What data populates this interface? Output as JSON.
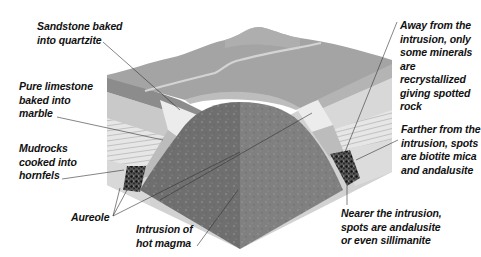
{
  "diagram": {
    "colors": {
      "background": "#ffffff",
      "top_surface": "#a4a4a4",
      "top_ridge": "#b2b2b2",
      "vein": "#d4d4d4",
      "dark_band": "#8c8c8c",
      "sandstone_layer": "#c9c9c9",
      "limestone_layer": "#dedede",
      "marble_zone": "#ececec",
      "mudrock_striped": "#e6e6e6",
      "aureole_light": "#bcbcbc",
      "hornfels_spotted": "#2a2a2a",
      "magma_left": "#6f6f6f",
      "magma_right": "#808080",
      "leader_line": "#333333",
      "text": "#111111"
    }
  },
  "labels": [
    {
      "id": "sandstone",
      "text": "Sandstone baked\ninto quartzite",
      "x": 37,
      "y": 20
    },
    {
      "id": "limestone",
      "text": "Pure limestone\nbaked into\nmarble",
      "x": 19,
      "y": 80
    },
    {
      "id": "mudrocks",
      "text": "Mudrocks\ncooked into\nhornfels",
      "x": 19,
      "y": 142
    },
    {
      "id": "aureole",
      "text": "Aureole",
      "x": 71,
      "y": 211
    },
    {
      "id": "intrusion",
      "text": "Intrusion of\nhot magma",
      "x": 136,
      "y": 223
    },
    {
      "id": "away",
      "text": "Away from the\nintrusion, only\nsome minerals\nare recrystallized\ngiving spotted\nrock",
      "x": 400,
      "y": 19
    },
    {
      "id": "farther",
      "text": "Farther from the\nintrusion, spots\nare biotite mica\nand andalusite",
      "x": 401,
      "y": 123
    },
    {
      "id": "nearer",
      "text": "Nearer the intrusion,\nspots are andalusite\nor even sillimanite",
      "x": 341,
      "y": 207
    }
  ]
}
